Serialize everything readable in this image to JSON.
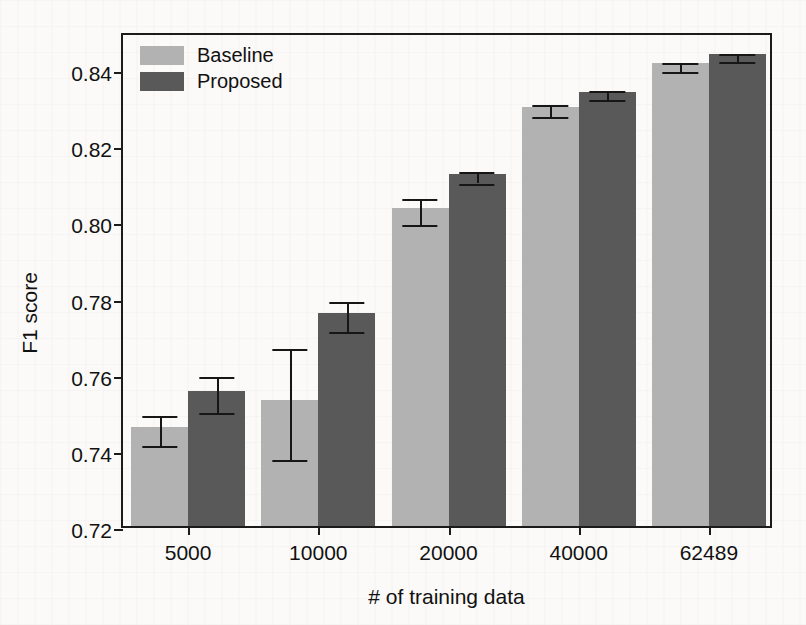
{
  "chart_data": {
    "type": "bar",
    "title": "",
    "xlabel": "# of training data",
    "ylabel": "F1 score",
    "categories": [
      "5000",
      "10000",
      "20000",
      "40000",
      "62489"
    ],
    "ylim": [
      0.72,
      0.85
    ],
    "yticks": [
      0.72,
      0.74,
      0.76,
      0.78,
      0.8,
      0.82,
      0.84
    ],
    "ytick_labels": [
      "0.72",
      "0.74",
      "0.76",
      "0.78",
      "0.80",
      "0.82",
      "0.84"
    ],
    "grid": false,
    "legend_position": "upper left",
    "series": [
      {
        "name": "Baseline",
        "color": "#b2b2b2",
        "values": [
          0.746,
          0.753,
          0.8035,
          0.83,
          0.8415
        ],
        "errors": [
          0.004,
          0.0145,
          0.0035,
          0.0015,
          0.0012
        ]
      },
      {
        "name": "Proposed",
        "color": "#595959",
        "values": [
          0.7555,
          0.776,
          0.8125,
          0.834,
          0.844
        ],
        "errors": [
          0.0048,
          0.004,
          0.0015,
          0.0012,
          0.001
        ]
      }
    ]
  },
  "axes": {
    "y_title": "F1 score",
    "x_title": "# of training data"
  },
  "legend": {
    "items": [
      {
        "label": "Baseline",
        "color": "#b2b2b2"
      },
      {
        "label": "Proposed",
        "color": "#595959"
      }
    ]
  },
  "colors": {
    "baseline": "#b2b2b2",
    "proposed": "#595959",
    "axis": "#1b1b1b",
    "background": "#fbfaf8"
  }
}
